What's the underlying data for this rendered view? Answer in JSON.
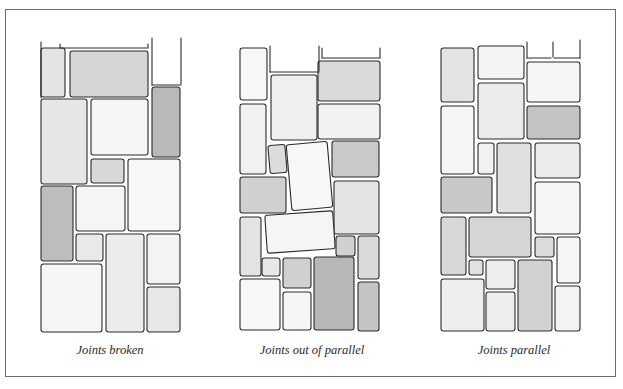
{
  "figure": {
    "panels": [
      {
        "id": "joints-broken",
        "caption": "Joints broken",
        "caption_x": 110,
        "open_lines": [
          [
            [
              41,
              42
            ],
            [
              41,
              98
            ]
          ],
          [
            [
              60,
              44
            ],
            [
              60,
              48
            ],
            [
              148,
              48
            ],
            [
              148,
              44
            ]
          ],
          [
            [
              152,
              38
            ],
            [
              152,
              85
            ]
          ],
          [
            [
              181,
              38
            ],
            [
              181,
              84
            ]
          ],
          [
            [
              152,
              85
            ],
            [
              181,
              85
            ]
          ]
        ],
        "stones": [
          {
            "x": 41,
            "y": 48,
            "w": 24,
            "h": 49,
            "shade": "#e4e4e4"
          },
          {
            "x": 70,
            "y": 51,
            "w": 78,
            "h": 46,
            "shade": "#d6d6d6"
          },
          {
            "x": 152,
            "y": 87,
            "w": 28,
            "h": 70,
            "shade": "#b9b9b9"
          },
          {
            "x": 41,
            "y": 99,
            "w": 46,
            "h": 85,
            "shade": "#e6e6e6"
          },
          {
            "x": 91,
            "y": 99,
            "w": 57,
            "h": 56,
            "shade": "#f6f6f6"
          },
          {
            "x": 91,
            "y": 159,
            "w": 33,
            "h": 24,
            "shade": "#d8d8d8"
          },
          {
            "x": 128,
            "y": 159,
            "w": 52,
            "h": 72,
            "shade": "#f7f7f7"
          },
          {
            "x": 41,
            "y": 186,
            "w": 32,
            "h": 75,
            "shade": "#bdbdbd"
          },
          {
            "x": 76,
            "y": 186,
            "w": 49,
            "h": 45,
            "shade": "#f5f5f5"
          },
          {
            "x": 76,
            "y": 234,
            "w": 27,
            "h": 27,
            "shade": "#e9e9e9"
          },
          {
            "x": 106,
            "y": 234,
            "w": 38,
            "h": 98,
            "shade": "#ececec"
          },
          {
            "x": 147,
            "y": 234,
            "w": 33,
            "h": 50,
            "shade": "#f3f3f3"
          },
          {
            "x": 41,
            "y": 264,
            "w": 61,
            "h": 68,
            "shade": "#f6f6f6"
          },
          {
            "x": 147,
            "y": 287,
            "w": 33,
            "h": 45,
            "shade": "#e7e7e7"
          }
        ]
      },
      {
        "id": "joints-out-of-parallel",
        "caption": "Joints out of parallel",
        "caption_x": 312,
        "open_lines": [
          [
            [
              270,
              46
            ],
            [
              270,
              72
            ]
          ],
          [
            [
              319,
              46
            ],
            [
              319,
              71
            ]
          ],
          [
            [
              270,
              72
            ],
            [
              319,
              72
            ]
          ],
          [
            [
              322,
              48
            ],
            [
              322,
              58
            ],
            [
              380,
              58
            ],
            [
              380,
              48
            ]
          ]
        ],
        "stones": [
          {
            "x": 240,
            "y": 48,
            "w": 27,
            "h": 52,
            "shade": "#f7f7f7"
          },
          {
            "x": 240,
            "y": 104,
            "w": 26,
            "h": 70,
            "shade": "#f1f1f1"
          },
          {
            "x": 271,
            "y": 75,
            "w": 46,
            "h": 65,
            "shade": "#efefef"
          },
          {
            "x": 318,
            "y": 61,
            "w": 62,
            "h": 40,
            "shade": "#dadada"
          },
          {
            "x": 318,
            "y": 104,
            "w": 62,
            "h": 35,
            "shade": "#f2f2f2"
          },
          {
            "x": 269,
            "y": 145,
            "w": 17,
            "h": 28,
            "shade": "#dcdcdc",
            "rot": -5
          },
          {
            "x": 289,
            "y": 143,
            "w": 41,
            "h": 66,
            "shade": "#f8f8f8",
            "rot": -5
          },
          {
            "x": 332,
            "y": 141,
            "w": 47,
            "h": 36,
            "shade": "#c9c9c9"
          },
          {
            "x": 240,
            "y": 177,
            "w": 46,
            "h": 36,
            "shade": "#d0d0d0"
          },
          {
            "x": 334,
            "y": 181,
            "w": 45,
            "h": 53,
            "shade": "#e4e4e4"
          },
          {
            "x": 240,
            "y": 217,
            "w": 21,
            "h": 59,
            "shade": "#e3e3e3"
          },
          {
            "x": 266,
            "y": 213,
            "w": 68,
            "h": 38,
            "shade": "#f5f5f5",
            "rot": -4
          },
          {
            "x": 336,
            "y": 236,
            "w": 19,
            "h": 20,
            "shade": "#d0d0d0"
          },
          {
            "x": 358,
            "y": 236,
            "w": 21,
            "h": 43,
            "shade": "#dadada"
          },
          {
            "x": 262,
            "y": 258,
            "w": 18,
            "h": 18,
            "shade": "#e8e8e8"
          },
          {
            "x": 283,
            "y": 258,
            "w": 28,
            "h": 30,
            "shade": "#cfcfcf"
          },
          {
            "x": 314,
            "y": 257,
            "w": 40,
            "h": 73,
            "shade": "#b7b7b7"
          },
          {
            "x": 240,
            "y": 279,
            "w": 40,
            "h": 51,
            "shade": "#f8f8f8"
          },
          {
            "x": 283,
            "y": 292,
            "w": 28,
            "h": 38,
            "shade": "#f6f6f6"
          },
          {
            "x": 358,
            "y": 282,
            "w": 21,
            "h": 49,
            "shade": "#c4c4c4"
          }
        ]
      },
      {
        "id": "joints-parallel",
        "caption": "Joints parallel",
        "caption_x": 514,
        "open_lines": [
          [
            [
              527,
              42
            ],
            [
              527,
              58
            ]
          ],
          [
            [
              553,
              42
            ],
            [
              553,
              57
            ]
          ],
          [
            [
              580,
              40
            ],
            [
              580,
              58
            ]
          ],
          [
            [
              527,
              58
            ],
            [
              551,
              58
            ]
          ],
          [
            [
              554,
              58
            ],
            [
              580,
              58
            ]
          ]
        ],
        "stones": [
          {
            "x": 441,
            "y": 48,
            "w": 33,
            "h": 54,
            "shade": "#e3e3e3"
          },
          {
            "x": 478,
            "y": 46,
            "w": 46,
            "h": 33,
            "shade": "#f4f4f4"
          },
          {
            "x": 478,
            "y": 83,
            "w": 46,
            "h": 56,
            "shade": "#ebebeb"
          },
          {
            "x": 527,
            "y": 62,
            "w": 53,
            "h": 40,
            "shade": "#f6f6f6"
          },
          {
            "x": 527,
            "y": 106,
            "w": 53,
            "h": 33,
            "shade": "#c3c3c3"
          },
          {
            "x": 441,
            "y": 106,
            "w": 33,
            "h": 68,
            "shade": "#f6f6f6"
          },
          {
            "x": 478,
            "y": 143,
            "w": 16,
            "h": 31,
            "shade": "#f1f1f1"
          },
          {
            "x": 497,
            "y": 143,
            "w": 34,
            "h": 70,
            "shade": "#e0e0e0"
          },
          {
            "x": 535,
            "y": 143,
            "w": 45,
            "h": 35,
            "shade": "#ececec"
          },
          {
            "x": 441,
            "y": 177,
            "w": 51,
            "h": 36,
            "shade": "#c8c8c8"
          },
          {
            "x": 535,
            "y": 182,
            "w": 45,
            "h": 52,
            "shade": "#f6f6f6"
          },
          {
            "x": 441,
            "y": 217,
            "w": 25,
            "h": 58,
            "shade": "#d8d8d8"
          },
          {
            "x": 469,
            "y": 217,
            "w": 62,
            "h": 40,
            "shade": "#d6d6d6"
          },
          {
            "x": 535,
            "y": 237,
            "w": 19,
            "h": 20,
            "shade": "#dcdcdc"
          },
          {
            "x": 557,
            "y": 237,
            "w": 23,
            "h": 46,
            "shade": "#f6f6f6"
          },
          {
            "x": 469,
            "y": 260,
            "w": 14,
            "h": 15,
            "shade": "#e1e1e1"
          },
          {
            "x": 486,
            "y": 260,
            "w": 29,
            "h": 29,
            "shade": "#ededed"
          },
          {
            "x": 518,
            "y": 260,
            "w": 34,
            "h": 71,
            "shade": "#d2d2d2"
          },
          {
            "x": 441,
            "y": 279,
            "w": 43,
            "h": 52,
            "shade": "#eeeeee"
          },
          {
            "x": 486,
            "y": 292,
            "w": 29,
            "h": 39,
            "shade": "#eeeeee"
          },
          {
            "x": 555,
            "y": 286,
            "w": 25,
            "h": 45,
            "shade": "#f3f3f3"
          }
        ]
      }
    ]
  },
  "colors": {
    "frame": "#6e6e6e",
    "ink": "#2b2b2b",
    "background": "#ffffff"
  }
}
